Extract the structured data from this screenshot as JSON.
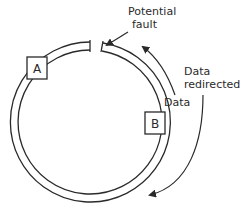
{
  "diagram": {
    "type": "ring-network-fault",
    "nodes": [
      {
        "id": "A",
        "label": "A"
      },
      {
        "id": "B",
        "label": "B"
      }
    ],
    "labels": {
      "fault_line1": "Potential",
      "fault_line2": "fault",
      "data": "Data",
      "redirected_line1": "Data",
      "redirected_line2": "redirected"
    },
    "colors": {
      "stroke": "#2a2a2a",
      "background": "#ffffff"
    }
  }
}
